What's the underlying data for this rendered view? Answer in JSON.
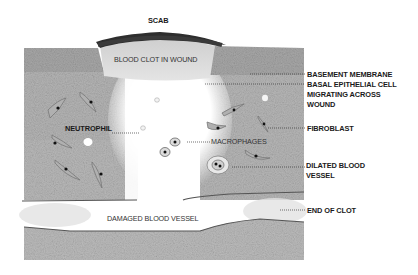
{
  "diagram": {
    "title_label": "SCAB",
    "labels": {
      "scab": "SCAB",
      "blood_clot": "BLOOD CLOT IN WOUND",
      "basement_membrane": "BASEMENT MEMBRANE",
      "basal_epithelial_line1": "BASAL EPITHELIAL CELL",
      "basal_epithelial_line2": "MIGRATING ACROSS",
      "basal_epithelial_line3": "WOUND",
      "neutrophil": "NEUTROPHIL",
      "macrophages": "MACROPHAGES",
      "fibroblast": "FIBROBLAST",
      "dilated_line1": "DILATED BLOOD",
      "dilated_line2": "VESSEL",
      "damaged_vessel": "DAMAGED BLOOD VESSEL",
      "end_of_clot": "END OF CLOT"
    },
    "colors": {
      "tissue": "#b8b8b8",
      "epidermis": "#a9a9a9",
      "scab": "#2e2e2e",
      "clot": "#d6d6d6",
      "vessel_line": "#555555",
      "background": "#ffffff"
    }
  }
}
